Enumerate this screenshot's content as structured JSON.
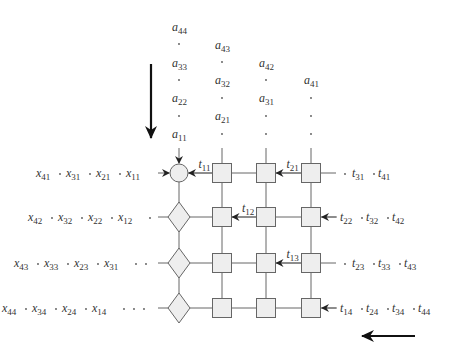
{
  "diagram": {
    "type": "systolic-array",
    "grid": {
      "rows": 4,
      "cols": 4,
      "col_x": [
        179,
        222,
        266,
        311
      ],
      "row_y": [
        173,
        217,
        263,
        308
      ],
      "first_col_shapes": [
        "circle",
        "diamond",
        "diamond",
        "diamond"
      ],
      "other_shapes": "square"
    },
    "top_inputs": {
      "columns": [
        {
          "x": 179,
          "items": [
            {
              "base": "a",
              "sub": "44",
              "y": 31
            },
            {
              "dot": true,
              "y": 44
            },
            {
              "base": "a",
              "sub": "33",
              "y": 67
            },
            {
              "dot": true,
              "y": 80
            },
            {
              "base": "a",
              "sub": "22",
              "y": 102
            },
            {
              "dot": true,
              "y": 116
            },
            {
              "base": "a",
              "sub": "11",
              "y": 138
            }
          ]
        },
        {
          "x": 222,
          "items": [
            {
              "base": "a",
              "sub": "43",
              "y": 49
            },
            {
              "dot": true,
              "y": 62
            },
            {
              "base": "a",
              "sub": "32",
              "y": 84
            },
            {
              "dot": true,
              "y": 98
            },
            {
              "base": "a",
              "sub": "21",
              "y": 120
            },
            {
              "dot": true,
              "y": 134
            }
          ]
        },
        {
          "x": 266,
          "items": [
            {
              "base": "a",
              "sub": "42",
              "y": 67
            },
            {
              "dot": true,
              "y": 80
            },
            {
              "base": "a",
              "sub": "31",
              "y": 102
            },
            {
              "dot": true,
              "y": 116
            },
            {
              "dot": true,
              "y": 134
            }
          ]
        },
        {
          "x": 311,
          "items": [
            {
              "base": "a",
              "sub": "41",
              "y": 84
            },
            {
              "dot": true,
              "y": 98
            },
            {
              "dot": true,
              "y": 116
            },
            {
              "dot": true,
              "y": 134
            }
          ]
        }
      ]
    },
    "left_inputs": [
      {
        "text": [
          "x41",
          "x31",
          "x21",
          "x11"
        ],
        "trail_dots": 0
      },
      {
        "text": [
          "x42",
          "x32",
          "x22",
          "x12"
        ],
        "trail_dots": 1
      },
      {
        "text": [
          "x43",
          "x33",
          "x23",
          "x31"
        ],
        "trail_dots": 2
      },
      {
        "text": [
          "x44",
          "x34",
          "x24",
          "x14"
        ],
        "trail_dots": 3
      }
    ],
    "right_inputs": [
      {
        "lead_dots": 1,
        "text": [
          "t31",
          "t41"
        ],
        "arrow": false
      },
      {
        "lead_dots": 0,
        "text": [
          "t22",
          "t32",
          "t42"
        ],
        "arrow": true
      },
      {
        "lead_dots": 1,
        "text": [
          "t23",
          "t33",
          "t43"
        ],
        "arrow": false
      },
      {
        "lead_dots": 0,
        "text": [
          "t14",
          "t24",
          "t34",
          "t44"
        ],
        "arrow": true
      }
    ],
    "internal_labels": [
      {
        "text": "t11",
        "row": 0,
        "between": [
          0,
          1
        ]
      },
      {
        "text": "t21",
        "row": 0,
        "between": [
          2,
          3
        ]
      },
      {
        "text": "t12",
        "row": 1,
        "between": [
          1,
          2
        ]
      },
      {
        "text": "t13",
        "row": 2,
        "between": [
          2,
          3
        ]
      }
    ],
    "flow_arrows": [
      {
        "direction": "down",
        "meaning": "a data flow"
      },
      {
        "direction": "left",
        "meaning": "t data flow"
      }
    ]
  }
}
